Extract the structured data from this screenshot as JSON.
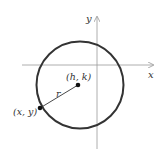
{
  "diagram": {
    "type": "circle-on-coordinate-plane",
    "axes": {
      "x_label": "x",
      "y_label": "y"
    },
    "circle": {
      "center_label": "(h, k)",
      "radius_label": "r",
      "point_label": "(x, y)"
    },
    "colors": {
      "circle": "#333333",
      "axis": "#999999",
      "text": "#333333"
    }
  }
}
